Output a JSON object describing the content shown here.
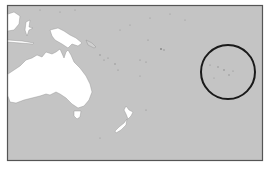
{
  "map": {
    "type": "locator-map",
    "region": "Oceania",
    "colors": {
      "ocean": "#c4c4c4",
      "land": "#ffffff",
      "border": "#555555",
      "highlight_circle": "#1a1a1a",
      "background": "#ffffff"
    },
    "frame": {
      "x": 7,
      "y": 5,
      "width": 256,
      "height": 156
    },
    "highlight": {
      "cx": 228,
      "cy": 72,
      "r": 27,
      "stroke_width": 2
    },
    "landmasses": [
      "Australia",
      "Tasmania",
      "New Guinea",
      "New Zealand North Island",
      "New Zealand South Island",
      "Borneo (partial)",
      "Sulawesi",
      "Solomon Islands",
      "Pacific islands"
    ]
  }
}
